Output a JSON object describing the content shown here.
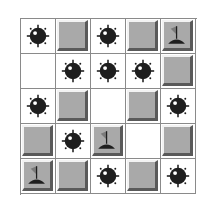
{
  "game": {
    "title": "Minesweeper board",
    "rows": 5,
    "cols": 5,
    "legend": {
      "mine": "mine-icon",
      "flag": "flag-icon",
      "covered": "covered-tile",
      "empty": "revealed-empty"
    },
    "colors": {
      "tile": "#a9a9a9",
      "tile_highlight": "#f2f2f2",
      "tile_shadow": "#5a5a5a",
      "grid_line": "#8a8a8a",
      "mine": "#1e1e1e",
      "flag": "#7a7a7a"
    },
    "grid": [
      [
        "mine",
        "covered",
        "mine",
        "covered",
        "flag"
      ],
      [
        "empty",
        "mine",
        "mine",
        "mine",
        "covered"
      ],
      [
        "mine",
        "covered",
        "empty",
        "covered",
        "mine"
      ],
      [
        "covered",
        "mine",
        "flag",
        "empty",
        "covered"
      ],
      [
        "flag",
        "covered",
        "mine",
        "covered",
        "mine"
      ]
    ]
  }
}
